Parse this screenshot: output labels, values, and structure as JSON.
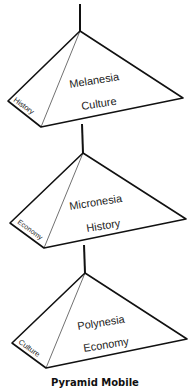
{
  "title": "Pyramid Mobile",
  "pyramids": [
    {
      "region": "Melanesia",
      "front_face": "Culture",
      "side_face": "History"
    },
    {
      "region": "Micronesia",
      "front_face": "History",
      "side_face": "Economy"
    },
    {
      "region": "Polynesia",
      "front_face": "Economy",
      "side_face": "Culture"
    }
  ],
  "colors": {
    "line": "#111111",
    "background": "#ffffff"
  }
}
